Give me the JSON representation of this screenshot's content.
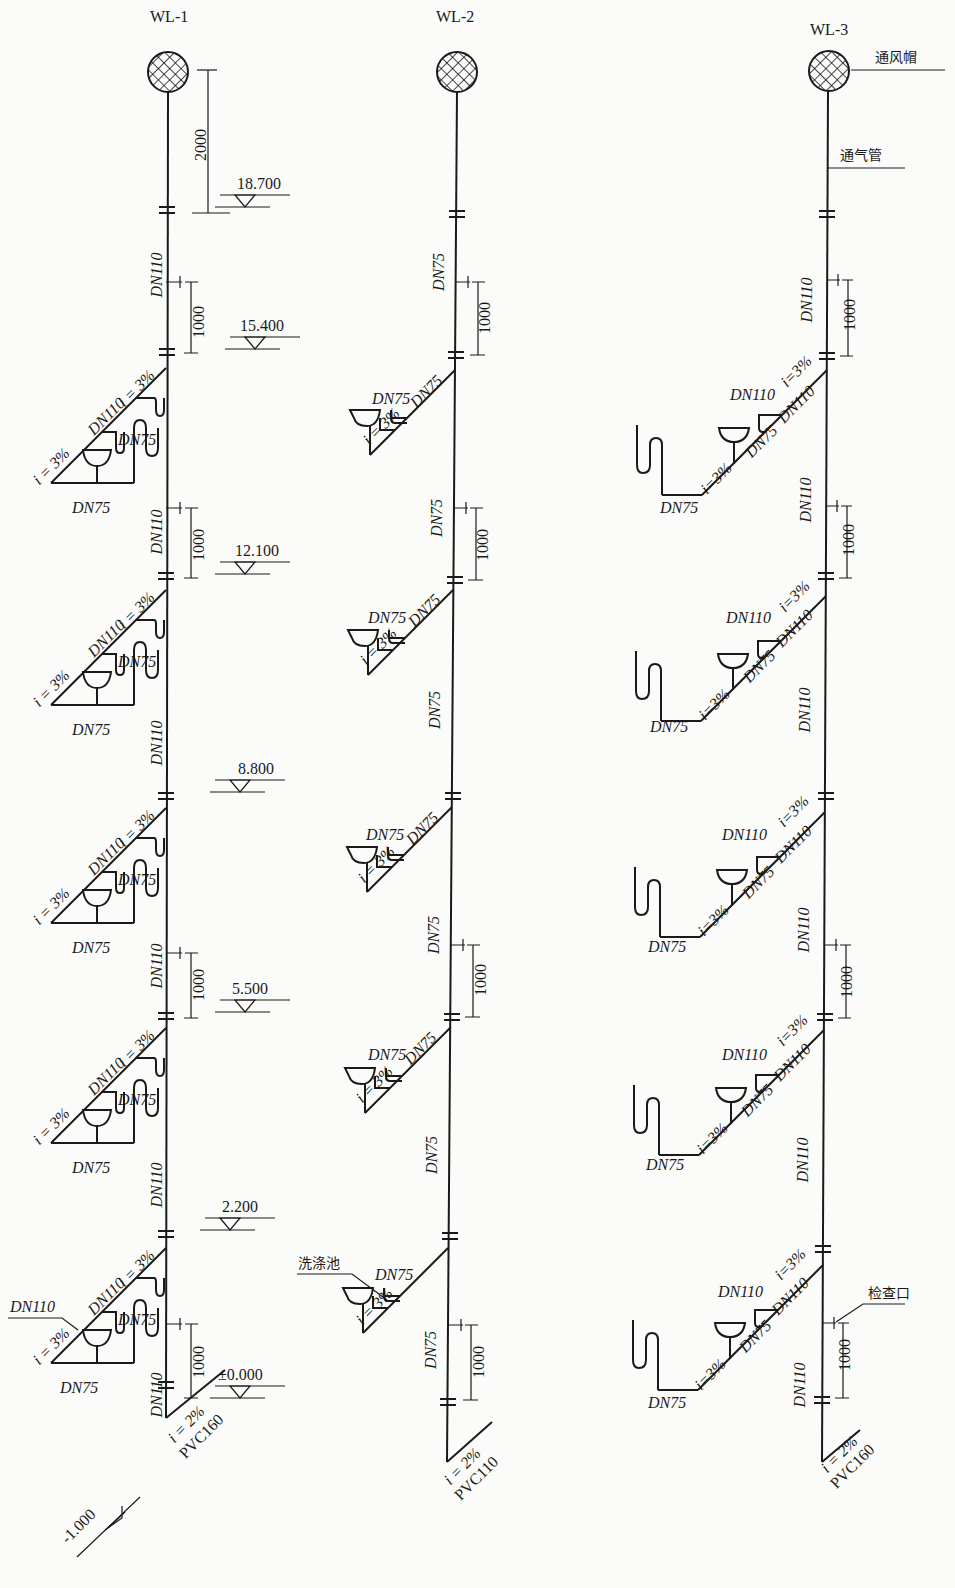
{
  "risers": [
    {
      "id": "WL-1",
      "label": "WL-1",
      "riser_x": 166,
      "stack_size_upper": "DN110",
      "stack_size_mid": "DN110",
      "branch": {
        "main_size": "DN110",
        "slope": "i = 3%",
        "trap_size": "DN75",
        "bottom_size": "DN75"
      },
      "dimension_top": "2000",
      "dimension_cleanout": "1000",
      "outlet": {
        "slope": "i = 2%",
        "pipe": "PVC160",
        "size": "DN110"
      },
      "callout_branch": "DN110"
    },
    {
      "id": "WL-2",
      "label": "WL-2",
      "riser_x": 447,
      "stack_size": "DN75",
      "branch": {
        "main_size": "DN75",
        "slope": "i = 3%",
        "trap_size": "DN75"
      },
      "dimension_cleanout": "1000",
      "outlet": {
        "slope": "i = 2%",
        "pipe": "PVC110"
      },
      "callout_sink": "洗涤池"
    },
    {
      "id": "WL-3",
      "label": "WL-3",
      "riser_x": 827,
      "stack_size": "DN110",
      "branch": {
        "main_size": "DN110",
        "slope_top": "i=3%",
        "mid_size": "DN75",
        "slope_low": "i=3%",
        "trap_size": "DN110",
        "bottom_size": "DN75"
      },
      "dimension_cleanout": "1000",
      "outlet": {
        "slope": "i = 2%",
        "pipe": "PVC160",
        "size": "DN110"
      },
      "callout_vent_cap": "通风帽",
      "callout_vent_pipe": "通气管",
      "callout_cleanout": "检查口"
    }
  ],
  "elevations": [
    {
      "label": "18.700"
    },
    {
      "label": "15.400"
    },
    {
      "label": "12.100"
    },
    {
      "label": "8.800"
    },
    {
      "label": "5.500"
    },
    {
      "label": "2.200"
    },
    {
      "label": "±0.000"
    },
    {
      "label": "-1.000"
    }
  ],
  "labels": {
    "dn110": "DN110",
    "dn75": "DN75",
    "i3": "i = 3%",
    "i3c": "i=3%",
    "i2": "i = 2%",
    "pvc160": "PVC160",
    "pvc110": "PVC110",
    "d1000": "1000",
    "d2000": "2000"
  }
}
